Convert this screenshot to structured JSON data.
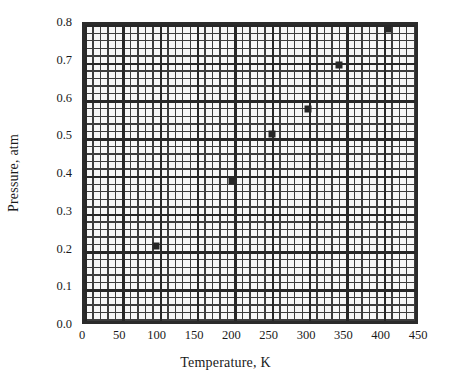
{
  "chart_data": {
    "type": "scatter",
    "title": "",
    "xlabel": "Temperature, K",
    "ylabel": "Pressure, atm",
    "xlim": [
      0,
      450
    ],
    "ylim": [
      0.0,
      0.8
    ],
    "grid": "major-and-minor",
    "legend": "none",
    "marker": "filled-square",
    "marker_color": "#262626",
    "xticks": [
      "0",
      "50",
      "100",
      "150",
      "200",
      "250",
      "300",
      "350",
      "400",
      "450"
    ],
    "xtick_values": [
      0,
      50,
      100,
      150,
      200,
      250,
      300,
      350,
      400,
      450
    ],
    "yticks": [
      "0.0",
      "0.1",
      "0.2",
      "0.3",
      "0.4",
      "0.5",
      "0.6",
      "0.7",
      "0.8"
    ],
    "ytick_values": [
      0.0,
      0.1,
      0.2,
      0.3,
      0.4,
      0.5,
      0.6,
      0.7,
      0.8
    ],
    "x_minor_step": 10,
    "y_minor_step": 0.02,
    "series": [
      {
        "name": "Pressure vs Temperature",
        "x": [
          95,
          197,
          250,
          299,
          340,
          406
        ],
        "y": [
          0.215,
          0.387,
          0.51,
          0.578,
          0.694,
          0.79
        ]
      }
    ]
  },
  "axes": {
    "x_title": "Temperature, K",
    "y_title": "Pressure, atm"
  }
}
